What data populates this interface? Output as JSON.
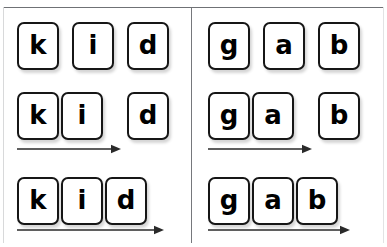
{
  "figure": {
    "background_color": "#ffffff",
    "width": 387,
    "height": 247,
    "frame": {
      "top_line_color": "#6f7175",
      "side_line_color": "#d8d9da",
      "divider_color": "#76787c"
    },
    "tile_style": {
      "fill": "#ffffff",
      "border_color": "#161616",
      "text_color": "#000000",
      "corner_radius_px": 7,
      "width_px": 42,
      "height_px": 48
    },
    "arrow_color": "#2a2a2a"
  },
  "panels": [
    {
      "id": "panel-left",
      "word": "kid",
      "rows": [
        {
          "id": "left-row-1",
          "stage": "separated",
          "has_arrow": false,
          "arrow_length_px": 0,
          "tiles": [
            {
              "letter": "k",
              "x": 17,
              "y": 22
            },
            {
              "letter": "i",
              "x": 72,
              "y": 22
            },
            {
              "letter": "d",
              "x": 127,
              "y": 22
            }
          ]
        },
        {
          "id": "left-row-2",
          "stage": "partially-blended",
          "has_arrow": true,
          "arrow_x": 17,
          "arrow_y": 144,
          "arrow_length_px": 95,
          "tiles": [
            {
              "letter": "k",
              "x": 17,
              "y": 92
            },
            {
              "letter": "i",
              "x": 61,
              "y": 92
            },
            {
              "letter": "d",
              "x": 127,
              "y": 92
            }
          ]
        },
        {
          "id": "left-row-3",
          "stage": "fully-blended",
          "has_arrow": true,
          "arrow_x": 17,
          "arrow_y": 225,
          "arrow_length_px": 138,
          "tiles": [
            {
              "letter": "k",
              "x": 17,
              "y": 177
            },
            {
              "letter": "i",
              "x": 61,
              "y": 177
            },
            {
              "letter": "d",
              "x": 105,
              "y": 177
            }
          ]
        }
      ]
    },
    {
      "id": "panel-right",
      "word": "gab",
      "rows": [
        {
          "id": "right-row-1",
          "stage": "separated",
          "has_arrow": false,
          "arrow_length_px": 0,
          "tiles": [
            {
              "letter": "g",
              "x": 17,
              "y": 22
            },
            {
              "letter": "a",
              "x": 72,
              "y": 22
            },
            {
              "letter": "b",
              "x": 127,
              "y": 22
            }
          ]
        },
        {
          "id": "right-row-2",
          "stage": "partially-blended",
          "has_arrow": true,
          "arrow_x": 17,
          "arrow_y": 144,
          "arrow_length_px": 95,
          "tiles": [
            {
              "letter": "g",
              "x": 17,
              "y": 92
            },
            {
              "letter": "a",
              "x": 61,
              "y": 92
            },
            {
              "letter": "b",
              "x": 127,
              "y": 92
            }
          ]
        },
        {
          "id": "right-row-3",
          "stage": "fully-blended",
          "has_arrow": true,
          "arrow_x": 17,
          "arrow_y": 225,
          "arrow_length_px": 133,
          "tiles": [
            {
              "letter": "g",
              "x": 17,
              "y": 177
            },
            {
              "letter": "a",
              "x": 61,
              "y": 177
            },
            {
              "letter": "b",
              "x": 105,
              "y": 177
            }
          ]
        }
      ]
    }
  ]
}
